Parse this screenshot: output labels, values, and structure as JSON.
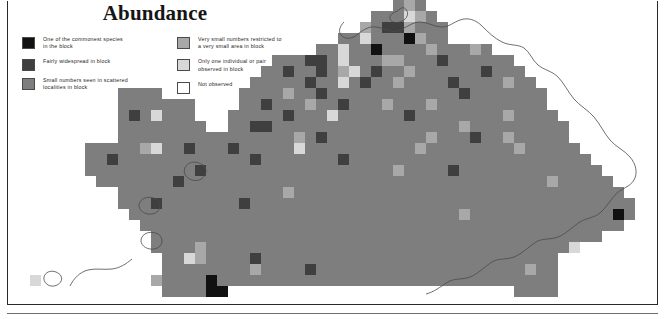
{
  "title": "Abundance",
  "legend": {
    "columns": [
      {
        "items": [
          {
            "label": "One of the commonest species\nin the block",
            "color": "#111111",
            "key": "commonest"
          },
          {
            "label": "Fairly widespread in block",
            "color": "#3f3f3f",
            "key": "fairly-widespread"
          },
          {
            "label": "Small numbers seen in scattered\nlocalities in block",
            "color": "#7e7e7e",
            "key": "small-numbers"
          }
        ]
      },
      {
        "items": [
          {
            "label": "Very small numbers restricted to\na very small area in block",
            "color": "#a8a8a8",
            "key": "very-small-numbers"
          },
          {
            "label": "Only one individual or pair\nobserved in block",
            "color": "#d8d8d8",
            "key": "one-individual"
          },
          {
            "label": "Not observed",
            "color": "#ffffff",
            "key": "not-observed"
          }
        ]
      }
    ]
  },
  "chart_data": {
    "type": "heatmap",
    "title": "Abundance",
    "xlabel": "",
    "ylabel": "",
    "grid": false,
    "legend_position": "top-left",
    "cell_px": 11,
    "origin": {
      "x": 8,
      "y": 0
    },
    "value_colors": {
      "0": "#ffffff",
      "1": "#d8d8d8",
      "2": "#a8a8a8",
      "3": "#7e7e7e",
      "4": "#3f3f3f",
      "5": "#111111"
    },
    "value_labels": {
      "0": "Not observed",
      "1": "Only one individual or pair observed in block",
      "2": "Very small numbers restricted to a very small area in block",
      "3": "Small numbers seen in scattered localities in block",
      "4": "Fairly widespread in block",
      "5": "One of the commonest species in the block"
    },
    "ncols": 59,
    "nrows": 27,
    "matrix": [
      [
        0,
        0,
        0,
        0,
        0,
        0,
        0,
        0,
        0,
        0,
        0,
        0,
        0,
        0,
        0,
        0,
        0,
        0,
        0,
        0,
        0,
        0,
        0,
        0,
        0,
        0,
        0,
        0,
        0,
        0,
        0,
        0,
        0,
        0,
        0,
        3,
        2,
        3,
        0,
        0,
        0,
        0,
        0,
        0,
        0,
        0,
        0,
        0,
        0,
        0,
        0,
        0,
        0,
        0,
        0,
        0,
        0,
        0,
        0
      ],
      [
        0,
        0,
        0,
        0,
        0,
        0,
        0,
        0,
        0,
        0,
        0,
        0,
        0,
        0,
        0,
        0,
        0,
        0,
        0,
        0,
        0,
        0,
        0,
        0,
        0,
        0,
        0,
        0,
        0,
        0,
        0,
        0,
        0,
        3,
        3,
        3,
        1,
        2,
        3,
        0,
        0,
        0,
        0,
        0,
        0,
        0,
        0,
        0,
        0,
        0,
        0,
        0,
        0,
        0,
        0,
        0,
        0,
        0,
        0
      ],
      [
        0,
        0,
        0,
        0,
        0,
        0,
        0,
        0,
        0,
        0,
        0,
        0,
        0,
        0,
        0,
        0,
        0,
        0,
        0,
        0,
        0,
        0,
        0,
        0,
        0,
        0,
        0,
        0,
        0,
        0,
        0,
        0,
        2,
        3,
        4,
        4,
        2,
        3,
        3,
        3,
        0,
        0,
        0,
        0,
        0,
        0,
        0,
        0,
        0,
        0,
        0,
        0,
        0,
        0,
        0,
        0,
        0,
        0,
        0
      ],
      [
        0,
        0,
        0,
        0,
        0,
        0,
        0,
        0,
        0,
        0,
        0,
        0,
        0,
        0,
        0,
        0,
        0,
        0,
        0,
        0,
        0,
        0,
        0,
        0,
        0,
        0,
        0,
        0,
        0,
        0,
        3,
        3,
        1,
        3,
        3,
        3,
        5,
        2,
        3,
        3,
        0,
        0,
        0,
        0,
        0,
        0,
        0,
        0,
        0,
        0,
        0,
        0,
        0,
        0,
        0,
        0,
        0,
        0,
        0
      ],
      [
        0,
        0,
        0,
        0,
        0,
        0,
        0,
        0,
        0,
        0,
        0,
        0,
        0,
        0,
        0,
        0,
        0,
        0,
        0,
        0,
        0,
        0,
        0,
        0,
        0,
        0,
        0,
        0,
        3,
        3,
        1,
        3,
        3,
        5,
        3,
        3,
        3,
        3,
        2,
        3,
        3,
        3,
        2,
        3,
        0,
        0,
        0,
        0,
        0,
        0,
        0,
        0,
        0,
        0,
        0,
        0,
        0,
        0,
        0
      ],
      [
        0,
        0,
        0,
        0,
        0,
        0,
        0,
        0,
        0,
        0,
        0,
        0,
        0,
        0,
        0,
        0,
        0,
        0,
        0,
        0,
        0,
        0,
        0,
        0,
        3,
        3,
        3,
        4,
        4,
        3,
        1,
        3,
        3,
        3,
        2,
        2,
        3,
        3,
        3,
        4,
        3,
        3,
        3,
        3,
        3,
        3,
        0,
        0,
        0,
        0,
        0,
        0,
        0,
        0,
        0,
        0,
        0,
        0,
        0
      ],
      [
        0,
        0,
        0,
        0,
        0,
        0,
        0,
        0,
        0,
        0,
        0,
        0,
        0,
        0,
        0,
        0,
        0,
        0,
        0,
        0,
        0,
        0,
        0,
        3,
        3,
        4,
        3,
        3,
        4,
        3,
        2,
        1,
        3,
        4,
        3,
        3,
        2,
        3,
        3,
        3,
        3,
        3,
        3,
        4,
        3,
        3,
        3,
        0,
        0,
        0,
        0,
        0,
        0,
        0,
        0,
        0,
        0,
        0,
        0
      ],
      [
        0,
        0,
        0,
        0,
        0,
        0,
        0,
        0,
        0,
        0,
        0,
        0,
        0,
        0,
        0,
        0,
        0,
        0,
        0,
        0,
        0,
        0,
        3,
        3,
        3,
        3,
        3,
        4,
        3,
        3,
        1,
        3,
        4,
        3,
        3,
        2,
        3,
        3,
        3,
        3,
        4,
        3,
        3,
        3,
        3,
        2,
        3,
        3,
        0,
        0,
        0,
        0,
        0,
        0,
        0,
        0,
        0,
        0,
        0
      ],
      [
        0,
        0,
        0,
        0,
        0,
        0,
        0,
        0,
        0,
        0,
        3,
        3,
        3,
        3,
        0,
        0,
        0,
        0,
        0,
        0,
        0,
        3,
        3,
        3,
        3,
        2,
        3,
        3,
        4,
        3,
        3,
        3,
        3,
        3,
        3,
        3,
        3,
        3,
        3,
        3,
        3,
        4,
        3,
        3,
        3,
        3,
        3,
        3,
        3,
        0,
        0,
        0,
        0,
        0,
        0,
        0,
        0,
        0,
        0
      ],
      [
        0,
        0,
        0,
        0,
        0,
        0,
        0,
        0,
        0,
        0,
        3,
        3,
        3,
        3,
        3,
        3,
        3,
        0,
        0,
        0,
        0,
        3,
        3,
        4,
        3,
        3,
        3,
        2,
        3,
        3,
        4,
        3,
        3,
        3,
        2,
        3,
        3,
        3,
        2,
        3,
        3,
        3,
        3,
        3,
        3,
        3,
        3,
        3,
        3,
        0,
        0,
        0,
        0,
        0,
        0,
        0,
        0,
        0,
        0
      ],
      [
        0,
        0,
        0,
        0,
        0,
        0,
        0,
        0,
        0,
        0,
        3,
        4,
        3,
        1,
        3,
        3,
        3,
        0,
        0,
        0,
        3,
        3,
        3,
        3,
        3,
        4,
        3,
        3,
        3,
        1,
        3,
        3,
        3,
        3,
        3,
        3,
        4,
        3,
        3,
        3,
        3,
        3,
        3,
        3,
        3,
        2,
        3,
        3,
        3,
        3,
        0,
        0,
        0,
        0,
        0,
        0,
        0,
        0,
        0
      ],
      [
        0,
        0,
        0,
        0,
        0,
        0,
        0,
        0,
        0,
        0,
        3,
        3,
        3,
        3,
        3,
        3,
        3,
        3,
        0,
        0,
        3,
        3,
        4,
        4,
        3,
        3,
        3,
        3,
        3,
        3,
        3,
        3,
        3,
        3,
        3,
        3,
        3,
        3,
        3,
        3,
        3,
        2,
        3,
        3,
        3,
        3,
        3,
        3,
        3,
        3,
        3,
        0,
        0,
        0,
        0,
        0,
        0,
        0,
        0
      ],
      [
        0,
        0,
        0,
        0,
        0,
        0,
        0,
        0,
        0,
        0,
        3,
        3,
        3,
        3,
        3,
        3,
        3,
        3,
        3,
        3,
        3,
        3,
        3,
        3,
        3,
        3,
        2,
        3,
        4,
        3,
        3,
        3,
        3,
        3,
        3,
        3,
        3,
        3,
        2,
        3,
        3,
        3,
        4,
        3,
        3,
        2,
        3,
        3,
        3,
        3,
        3,
        0,
        0,
        0,
        0,
        0,
        0,
        0,
        0
      ],
      [
        0,
        0,
        0,
        0,
        0,
        0,
        0,
        3,
        3,
        3,
        3,
        3,
        2,
        1,
        3,
        3,
        4,
        3,
        3,
        3,
        4,
        3,
        3,
        3,
        3,
        3,
        1,
        3,
        3,
        3,
        3,
        3,
        3,
        3,
        3,
        3,
        3,
        2,
        3,
        3,
        3,
        3,
        3,
        3,
        3,
        3,
        2,
        3,
        3,
        3,
        3,
        3,
        0,
        0,
        0,
        0,
        0,
        0,
        0
      ],
      [
        0,
        0,
        0,
        0,
        0,
        0,
        0,
        3,
        3,
        4,
        3,
        3,
        3,
        3,
        3,
        3,
        3,
        3,
        3,
        3,
        3,
        3,
        4,
        3,
        3,
        3,
        3,
        3,
        3,
        3,
        4,
        3,
        3,
        3,
        3,
        3,
        3,
        3,
        3,
        3,
        3,
        3,
        3,
        3,
        3,
        3,
        3,
        3,
        3,
        3,
        3,
        3,
        3,
        0,
        0,
        0,
        0,
        0,
        0
      ],
      [
        0,
        0,
        0,
        0,
        0,
        0,
        0,
        3,
        3,
        3,
        3,
        3,
        3,
        3,
        3,
        3,
        3,
        4,
        3,
        3,
        3,
        3,
        3,
        3,
        3,
        3,
        3,
        3,
        3,
        3,
        3,
        3,
        3,
        3,
        3,
        2,
        3,
        3,
        3,
        3,
        4,
        3,
        3,
        3,
        3,
        3,
        3,
        3,
        3,
        3,
        3,
        3,
        3,
        3,
        0,
        0,
        0,
        0,
        0
      ],
      [
        0,
        0,
        0,
        0,
        0,
        0,
        0,
        0,
        3,
        3,
        3,
        3,
        3,
        3,
        3,
        4,
        3,
        3,
        3,
        3,
        3,
        3,
        3,
        3,
        3,
        3,
        3,
        3,
        3,
        3,
        3,
        3,
        3,
        3,
        3,
        3,
        3,
        3,
        3,
        3,
        3,
        3,
        3,
        3,
        3,
        3,
        3,
        3,
        3,
        2,
        3,
        3,
        3,
        3,
        3,
        0,
        0,
        0,
        0
      ],
      [
        0,
        0,
        0,
        0,
        0,
        0,
        0,
        0,
        0,
        0,
        3,
        3,
        3,
        3,
        3,
        3,
        3,
        3,
        3,
        3,
        3,
        3,
        3,
        3,
        3,
        2,
        3,
        3,
        3,
        3,
        3,
        3,
        3,
        3,
        3,
        3,
        3,
        3,
        3,
        3,
        3,
        3,
        3,
        3,
        3,
        3,
        3,
        3,
        3,
        3,
        3,
        3,
        3,
        3,
        3,
        3,
        0,
        0,
        0
      ],
      [
        0,
        0,
        0,
        0,
        0,
        0,
        0,
        0,
        0,
        0,
        3,
        3,
        3,
        4,
        3,
        3,
        3,
        3,
        3,
        3,
        3,
        4,
        3,
        3,
        3,
        3,
        3,
        3,
        3,
        3,
        3,
        3,
        3,
        3,
        3,
        3,
        3,
        3,
        3,
        3,
        3,
        3,
        3,
        3,
        3,
        3,
        3,
        3,
        3,
        3,
        3,
        3,
        3,
        3,
        3,
        3,
        3,
        0,
        0
      ],
      [
        0,
        0,
        0,
        0,
        0,
        0,
        0,
        0,
        0,
        0,
        0,
        3,
        3,
        3,
        3,
        3,
        3,
        3,
        3,
        3,
        3,
        3,
        3,
        3,
        3,
        3,
        3,
        3,
        3,
        3,
        3,
        3,
        3,
        3,
        3,
        3,
        3,
        3,
        3,
        3,
        3,
        2,
        3,
        3,
        3,
        3,
        3,
        3,
        3,
        3,
        3,
        3,
        3,
        3,
        3,
        5,
        3,
        0,
        0
      ],
      [
        0,
        0,
        0,
        0,
        0,
        0,
        0,
        0,
        0,
        0,
        0,
        0,
        3,
        3,
        3,
        3,
        3,
        3,
        3,
        3,
        3,
        3,
        3,
        3,
        3,
        3,
        3,
        3,
        3,
        3,
        3,
        3,
        3,
        3,
        3,
        3,
        3,
        3,
        3,
        3,
        3,
        3,
        3,
        3,
        3,
        3,
        3,
        3,
        3,
        3,
        3,
        3,
        3,
        3,
        3,
        3,
        0,
        0,
        0
      ],
      [
        0,
        0,
        0,
        0,
        0,
        0,
        0,
        0,
        0,
        0,
        0,
        0,
        0,
        3,
        3,
        3,
        3,
        3,
        3,
        3,
        3,
        3,
        3,
        3,
        3,
        3,
        3,
        3,
        3,
        3,
        3,
        3,
        3,
        3,
        3,
        3,
        3,
        3,
        3,
        3,
        3,
        3,
        3,
        3,
        3,
        3,
        3,
        3,
        3,
        3,
        3,
        3,
        3,
        3,
        0,
        0,
        0,
        0,
        0
      ],
      [
        0,
        0,
        0,
        0,
        0,
        0,
        0,
        0,
        0,
        0,
        0,
        0,
        0,
        3,
        3,
        3,
        3,
        2,
        3,
        3,
        3,
        3,
        3,
        3,
        3,
        3,
        3,
        3,
        3,
        3,
        3,
        3,
        3,
        3,
        3,
        3,
        3,
        3,
        3,
        3,
        3,
        3,
        3,
        3,
        3,
        3,
        3,
        3,
        3,
        3,
        3,
        1,
        0,
        0,
        0,
        0,
        0,
        0,
        0
      ],
      [
        0,
        0,
        0,
        0,
        0,
        0,
        0,
        0,
        0,
        0,
        0,
        0,
        0,
        0,
        3,
        3,
        1,
        2,
        3,
        3,
        3,
        3,
        4,
        3,
        3,
        3,
        3,
        3,
        3,
        3,
        3,
        3,
        3,
        3,
        3,
        3,
        3,
        3,
        3,
        3,
        3,
        3,
        3,
        3,
        3,
        3,
        3,
        3,
        3,
        3,
        0,
        0,
        0,
        0,
        0,
        0,
        0,
        0,
        0
      ],
      [
        0,
        0,
        0,
        0,
        0,
        0,
        0,
        0,
        0,
        0,
        0,
        0,
        0,
        0,
        3,
        3,
        3,
        3,
        3,
        3,
        3,
        3,
        2,
        3,
        3,
        3,
        3,
        4,
        3,
        3,
        3,
        3,
        3,
        3,
        3,
        3,
        3,
        3,
        3,
        3,
        3,
        3,
        3,
        3,
        3,
        3,
        3,
        2,
        3,
        3,
        0,
        0,
        0,
        0,
        0,
        0,
        0,
        0,
        0
      ],
      [
        0,
        0,
        1,
        0,
        0,
        0,
        0,
        0,
        0,
        0,
        0,
        0,
        0,
        2,
        3,
        3,
        3,
        3,
        5,
        3,
        3,
        3,
        3,
        3,
        3,
        3,
        3,
        3,
        3,
        3,
        3,
        3,
        3,
        3,
        3,
        3,
        3,
        3,
        3,
        3,
        3,
        3,
        3,
        3,
        3,
        3,
        3,
        3,
        3,
        3,
        0,
        0,
        0,
        0,
        0,
        0,
        0,
        0,
        0
      ],
      [
        0,
        0,
        0,
        0,
        0,
        0,
        0,
        0,
        0,
        0,
        0,
        0,
        0,
        0,
        3,
        3,
        3,
        3,
        5,
        5,
        0,
        0,
        0,
        0,
        0,
        0,
        0,
        0,
        0,
        0,
        0,
        0,
        0,
        0,
        0,
        0,
        0,
        0,
        0,
        0,
        0,
        0,
        0,
        0,
        0,
        0,
        3,
        3,
        3,
        3,
        0,
        0,
        0,
        0,
        0,
        0,
        0,
        0,
        0
      ]
    ]
  }
}
